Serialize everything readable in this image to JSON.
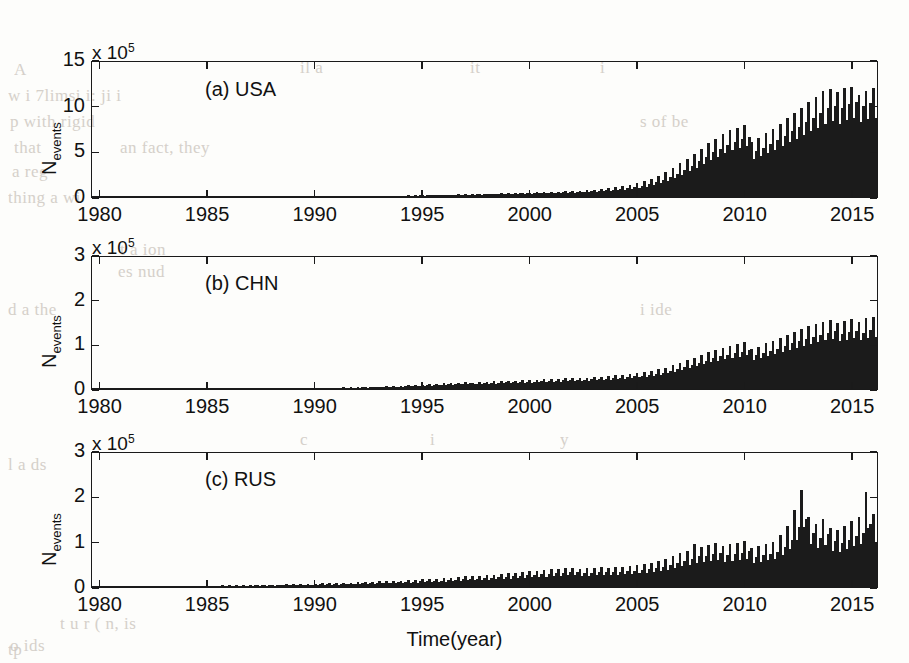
{
  "figure": {
    "xlabel": "Time(year)",
    "ylabel_main": "N",
    "ylabel_sub": "events",
    "exponent_prefix": "x 10",
    "exponent_power": "5",
    "x_ticks": [
      "1980",
      "1985",
      "1990",
      "1995",
      "2000",
      "2005",
      "2010",
      "2015"
    ],
    "bar_color": "#1b1b1b",
    "axis_color": "#1a1a1a",
    "background": "#fdfdfb"
  },
  "bleed_text": [
    {
      "t": "A",
      "x": 14,
      "y": 60
    },
    {
      "t": "w i  7limsi  i:  ji  i",
      "x": 8,
      "y": 86
    },
    {
      "t": "p  with  rigid",
      "x": 10,
      "y": 112
    },
    {
      "t": "that",
      "x": 14,
      "y": 138
    },
    {
      "t": "an  fact, they",
      "x": 120,
      "y": 138
    },
    {
      "t": "a  reg",
      "x": 12,
      "y": 162
    },
    {
      "t": "thing  a   wi",
      "x": 8,
      "y": 188
    },
    {
      "t": "il a",
      "x": 300,
      "y": 58
    },
    {
      "t": "it",
      "x": 470,
      "y": 58
    },
    {
      "t": "i",
      "x": 600,
      "y": 58
    },
    {
      "t": "s  of  be",
      "x": 640,
      "y": 112
    },
    {
      "t": "t  a  ion",
      "x": 120,
      "y": 240
    },
    {
      "t": "es  nud",
      "x": 118,
      "y": 262
    },
    {
      "t": "d  a  the",
      "x": 8,
      "y": 300
    },
    {
      "t": "i  ide",
      "x": 640,
      "y": 300
    },
    {
      "t": "c",
      "x": 300,
      "y": 430
    },
    {
      "t": "i",
      "x": 430,
      "y": 430
    },
    {
      "t": "y",
      "x": 560,
      "y": 430
    },
    {
      "t": "l  a  ds",
      "x": 8,
      "y": 455
    },
    {
      "t": "tp",
      "x": 8,
      "y": 640
    },
    {
      "t": "t u    r  (  n, is",
      "x": 60,
      "y": 614
    },
    {
      "t": "o  ids",
      "x": 10,
      "y": 636
    }
  ],
  "chart_data": [
    {
      "type": "bar",
      "panel_label": "(a) USA",
      "title": "",
      "xlabel": "",
      "ylabel": "N_events",
      "y_exponent": 100000,
      "ylim": [
        0,
        15
      ],
      "y_ticks": [
        0,
        5,
        10,
        15
      ],
      "xlim": [
        1979.6,
        2016.2
      ],
      "grid": false,
      "series_name": "USA",
      "x_start": 1979.7,
      "x_step": 0.0833,
      "values": [
        0.02,
        0.02,
        0.02,
        0.03,
        0.02,
        0.02,
        0.02,
        0.03,
        0.02,
        0.02,
        0.03,
        0.02,
        0.02,
        0.03,
        0.02,
        0.02,
        0.03,
        0.02,
        0.03,
        0.02,
        0.02,
        0.03,
        0.02,
        0.02,
        0.03,
        0.02,
        0.03,
        0.02,
        0.03,
        0.02,
        0.03,
        0.02,
        0.03,
        0.03,
        0.02,
        0.03,
        0.03,
        0.02,
        0.03,
        0.03,
        0.03,
        0.02,
        0.03,
        0.03,
        0.03,
        0.03,
        0.02,
        0.03,
        0.03,
        0.03,
        0.04,
        0.03,
        0.03,
        0.03,
        0.04,
        0.03,
        0.03,
        0.04,
        0.03,
        0.04,
        0.04,
        0.03,
        0.04,
        0.04,
        0.03,
        0.04,
        0.04,
        0.04,
        0.05,
        0.04,
        0.04,
        0.05,
        0.05,
        0.04,
        0.05,
        0.05,
        0.04,
        0.05,
        0.06,
        0.05,
        0.05,
        0.06,
        0.05,
        0.06,
        0.06,
        0.05,
        0.06,
        0.07,
        0.06,
        0.06,
        0.07,
        0.06,
        0.07,
        0.07,
        0.06,
        0.07,
        0.08,
        0.07,
        0.08,
        0.08,
        0.07,
        0.08,
        0.09,
        0.08,
        0.09,
        0.09,
        0.08,
        0.09,
        0.1,
        0.09,
        0.1,
        0.11,
        0.09,
        0.1,
        0.12,
        0.1,
        0.11,
        0.12,
        0.1,
        0.12,
        0.13,
        0.11,
        0.13,
        0.14,
        0.12,
        0.13,
        0.15,
        0.13,
        0.14,
        0.16,
        0.13,
        0.15,
        0.17,
        0.14,
        0.16,
        0.18,
        0.15,
        0.17,
        0.2,
        0.16,
        0.18,
        0.21,
        0.17,
        0.19,
        0.23,
        0.18,
        0.21,
        0.24,
        0.19,
        0.22,
        0.27,
        0.21,
        0.24,
        0.28,
        0.22,
        0.25,
        0.3,
        0.24,
        0.27,
        0.32,
        0.25,
        0.29,
        0.35,
        0.27,
        0.31,
        0.36,
        0.28,
        0.32,
        0.38,
        0.3,
        0.34,
        0.4,
        0.31,
        0.35,
        0.42,
        0.33,
        0.37,
        0.44,
        0.34,
        0.39,
        0.46,
        0.36,
        0.41,
        0.48,
        0.37,
        0.42,
        0.5,
        0.39,
        0.44,
        0.52,
        0.4,
        0.46,
        0.55,
        0.42,
        0.48,
        0.58,
        0.44,
        0.5,
        0.62,
        0.46,
        0.53,
        0.66,
        0.48,
        0.56,
        0.7,
        0.52,
        0.6,
        0.76,
        0.55,
        0.64,
        0.82,
        0.58,
        0.68,
        0.88,
        0.62,
        0.72,
        0.95,
        0.66,
        0.78,
        1.05,
        0.72,
        0.86,
        1.2,
        0.8,
        0.95,
        1.35,
        0.9,
        1.1,
        1.55,
        1.0,
        1.25,
        1.75,
        1.15,
        1.4,
        2.0,
        1.3,
        1.6,
        2.3,
        1.5,
        1.85,
        2.7,
        1.75,
        2.15,
        3.2,
        2.05,
        2.55,
        3.7,
        2.4,
        2.95,
        4.2,
        2.8,
        3.4,
        4.7,
        3.2,
        3.9,
        5.3,
        3.6,
        4.4,
        5.9,
        4.0,
        4.9,
        6.4,
        4.4,
        5.3,
        6.9,
        4.8,
        5.7,
        7.3,
        5.1,
        6.0,
        7.6,
        5.4,
        6.3,
        7.9,
        5.6,
        6.6,
        6.0,
        4.2,
        5.0,
        6.5,
        4.5,
        5.4,
        7.0,
        4.8,
        5.8,
        7.5,
        5.2,
        6.2,
        8.0,
        5.6,
        6.7,
        8.6,
        6.0,
        7.2,
        9.2,
        6.4,
        7.7,
        9.8,
        6.8,
        8.2,
        10.4,
        7.2,
        8.7,
        11.0,
        7.6,
        9.2,
        11.6,
        8.0,
        9.7,
        11.8,
        8.3,
        10.0,
        11.5,
        8.0,
        9.7,
        11.9,
        8.4,
        10.2,
        12.0,
        8.6,
        10.4,
        11.2,
        8.2,
        10.0,
        11.6,
        8.5,
        10.3,
        11.9,
        8.7,
        10.5
      ]
    },
    {
      "type": "bar",
      "panel_label": "(b) CHN",
      "title": "",
      "xlabel": "",
      "ylabel": "N_events",
      "y_exponent": 100000,
      "ylim": [
        0,
        3
      ],
      "y_ticks": [
        0,
        1,
        2,
        3
      ],
      "xlim": [
        1979.6,
        2016.2
      ],
      "grid": false,
      "series_name": "CHN",
      "x_start": 1979.7,
      "x_step": 0.0833,
      "values": [
        0.005,
        0.004,
        0.005,
        0.006,
        0.004,
        0.005,
        0.006,
        0.004,
        0.005,
        0.006,
        0.005,
        0.005,
        0.006,
        0.005,
        0.006,
        0.006,
        0.005,
        0.006,
        0.007,
        0.005,
        0.006,
        0.007,
        0.005,
        0.006,
        0.007,
        0.006,
        0.007,
        0.007,
        0.006,
        0.007,
        0.008,
        0.006,
        0.007,
        0.008,
        0.006,
        0.007,
        0.008,
        0.007,
        0.008,
        0.008,
        0.007,
        0.008,
        0.009,
        0.007,
        0.008,
        0.009,
        0.007,
        0.008,
        0.009,
        0.008,
        0.009,
        0.01,
        0.008,
        0.009,
        0.01,
        0.008,
        0.009,
        0.01,
        0.009,
        0.01,
        0.011,
        0.009,
        0.01,
        0.012,
        0.009,
        0.011,
        0.012,
        0.01,
        0.011,
        0.013,
        0.01,
        0.012,
        0.014,
        0.011,
        0.012,
        0.015,
        0.011,
        0.013,
        0.016,
        0.012,
        0.014,
        0.017,
        0.013,
        0.015,
        0.018,
        0.014,
        0.016,
        0.02,
        0.015,
        0.017,
        0.022,
        0.016,
        0.019,
        0.024,
        0.018,
        0.021,
        0.026,
        0.019,
        0.022,
        0.028,
        0.021,
        0.024,
        0.031,
        0.023,
        0.027,
        0.034,
        0.025,
        0.029,
        0.037,
        0.027,
        0.032,
        0.041,
        0.03,
        0.035,
        0.045,
        0.033,
        0.038,
        0.05,
        0.036,
        0.042,
        0.055,
        0.04,
        0.046,
        0.06,
        0.044,
        0.051,
        0.066,
        0.048,
        0.056,
        0.073,
        0.053,
        0.061,
        0.08,
        0.058,
        0.067,
        0.088,
        0.064,
        0.074,
        0.096,
        0.07,
        0.081,
        0.105,
        0.076,
        0.088,
        0.115,
        0.083,
        0.096,
        0.125,
        0.091,
        0.105,
        0.135,
        0.098,
        0.113,
        0.145,
        0.105,
        0.122,
        0.15,
        0.11,
        0.126,
        0.145,
        0.105,
        0.121,
        0.155,
        0.112,
        0.13,
        0.16,
        0.116,
        0.134,
        0.17,
        0.123,
        0.142,
        0.175,
        0.127,
        0.147,
        0.182,
        0.132,
        0.152,
        0.19,
        0.138,
        0.159,
        0.195,
        0.142,
        0.163,
        0.2,
        0.145,
        0.168,
        0.21,
        0.152,
        0.176,
        0.215,
        0.156,
        0.18,
        0.225,
        0.163,
        0.188,
        0.23,
        0.167,
        0.193,
        0.24,
        0.174,
        0.201,
        0.25,
        0.181,
        0.209,
        0.245,
        0.178,
        0.205,
        0.255,
        0.185,
        0.214,
        0.265,
        0.192,
        0.222,
        0.275,
        0.199,
        0.23,
        0.29,
        0.21,
        0.243,
        0.305,
        0.221,
        0.256,
        0.32,
        0.232,
        0.268,
        0.34,
        0.247,
        0.285,
        0.36,
        0.261,
        0.302,
        0.385,
        0.279,
        0.323,
        0.41,
        0.297,
        0.344,
        0.44,
        0.319,
        0.369,
        0.48,
        0.348,
        0.402,
        0.53,
        0.384,
        0.444,
        0.58,
        0.42,
        0.486,
        0.64,
        0.464,
        0.536,
        0.7,
        0.507,
        0.587,
        0.76,
        0.551,
        0.637,
        0.82,
        0.594,
        0.687,
        0.88,
        0.638,
        0.738,
        0.92,
        0.667,
        0.771,
        0.96,
        0.696,
        0.805,
        1.0,
        0.725,
        0.838,
        1.05,
        0.761,
        0.88,
        0.9,
        0.652,
        0.754,
        0.95,
        0.688,
        0.796,
        1.02,
        0.739,
        0.855,
        1.08,
        0.783,
        0.905,
        1.15,
        0.834,
        0.964,
        1.22,
        0.884,
        1.022,
        1.28,
        0.928,
        1.073,
        1.34,
        0.971,
        1.123,
        1.4,
        1.015,
        1.173,
        1.45,
        1.051,
        1.215,
        1.5,
        1.088,
        1.257,
        1.54,
        1.116,
        1.291,
        1.48,
        1.073,
        1.24,
        1.52,
        1.102,
        1.274,
        1.56,
        1.131,
        1.308,
        1.5,
        1.088,
        1.257,
        1.58,
        1.145,
        1.324,
        1.62,
        1.175,
        1.358
      ]
    },
    {
      "type": "bar",
      "panel_label": "(c) RUS",
      "title": "",
      "xlabel": "Time(year)",
      "ylabel": "N_events",
      "y_exponent": 100000,
      "ylim": [
        0,
        3
      ],
      "y_ticks": [
        0,
        1,
        2,
        3
      ],
      "xlim": [
        1979.6,
        2016.2
      ],
      "grid": false,
      "series_name": "RUS",
      "x_start": 1979.7,
      "x_step": 0.0833,
      "values": [
        0.01,
        0.008,
        0.012,
        0.03,
        0.009,
        0.011,
        0.014,
        0.009,
        0.012,
        0.015,
        0.01,
        0.012,
        0.016,
        0.01,
        0.013,
        0.017,
        0.011,
        0.013,
        0.018,
        0.011,
        0.014,
        0.019,
        0.012,
        0.015,
        0.02,
        0.013,
        0.016,
        0.021,
        0.013,
        0.016,
        0.022,
        0.014,
        0.017,
        0.023,
        0.015,
        0.018,
        0.024,
        0.015,
        0.019,
        0.026,
        0.016,
        0.02,
        0.028,
        0.017,
        0.021,
        0.029,
        0.018,
        0.022,
        0.031,
        0.019,
        0.024,
        0.033,
        0.02,
        0.025,
        0.035,
        0.022,
        0.027,
        0.055,
        0.023,
        0.028,
        0.039,
        0.024,
        0.03,
        0.041,
        0.026,
        0.032,
        0.044,
        0.027,
        0.034,
        0.046,
        0.029,
        0.036,
        0.049,
        0.03,
        0.038,
        0.052,
        0.032,
        0.04,
        0.055,
        0.034,
        0.042,
        0.058,
        0.036,
        0.045,
        0.062,
        0.038,
        0.048,
        0.065,
        0.04,
        0.05,
        0.069,
        0.043,
        0.053,
        0.073,
        0.045,
        0.056,
        0.078,
        0.048,
        0.06,
        0.082,
        0.051,
        0.063,
        0.087,
        0.054,
        0.067,
        0.092,
        0.057,
        0.071,
        0.098,
        0.06,
        0.075,
        0.103,
        0.064,
        0.08,
        0.109,
        0.067,
        0.084,
        0.115,
        0.071,
        0.089,
        0.135,
        0.078,
        0.098,
        0.128,
        0.079,
        0.099,
        0.135,
        0.083,
        0.104,
        0.142,
        0.088,
        0.11,
        0.15,
        0.092,
        0.116,
        0.158,
        0.097,
        0.122,
        0.166,
        0.102,
        0.128,
        0.175,
        0.108,
        0.135,
        0.185,
        0.114,
        0.143,
        0.195,
        0.12,
        0.151,
        0.205,
        0.126,
        0.158,
        0.215,
        0.133,
        0.166,
        0.24,
        0.148,
        0.186,
        0.235,
        0.145,
        0.182,
        0.248,
        0.153,
        0.192,
        0.26,
        0.16,
        0.201,
        0.275,
        0.17,
        0.213,
        0.288,
        0.178,
        0.223,
        0.3,
        0.185,
        0.232,
        0.315,
        0.194,
        0.244,
        0.33,
        0.203,
        0.255,
        0.345,
        0.213,
        0.267,
        0.36,
        0.222,
        0.278,
        0.375,
        0.231,
        0.29,
        0.39,
        0.24,
        0.302,
        0.405,
        0.25,
        0.313,
        0.418,
        0.258,
        0.323,
        0.43,
        0.265,
        0.333,
        0.395,
        0.244,
        0.306,
        0.41,
        0.253,
        0.317,
        0.425,
        0.262,
        0.329,
        0.44,
        0.271,
        0.34,
        0.42,
        0.259,
        0.325,
        0.435,
        0.268,
        0.337,
        0.45,
        0.278,
        0.348,
        0.47,
        0.29,
        0.364,
        0.49,
        0.302,
        0.379,
        0.51,
        0.315,
        0.395,
        0.54,
        0.333,
        0.418,
        0.57,
        0.352,
        0.441,
        0.62,
        0.382,
        0.48,
        0.68,
        0.419,
        0.526,
        0.74,
        0.456,
        0.573,
        0.8,
        0.493,
        0.619,
        0.95,
        0.54,
        0.678,
        0.88,
        0.542,
        0.681,
        0.93,
        0.573,
        0.72,
        0.98,
        0.604,
        0.758,
        0.9,
        0.555,
        0.697,
        0.94,
        0.579,
        0.727,
        0.98,
        0.604,
        0.758,
        1.02,
        0.629,
        0.789,
        0.85,
        0.524,
        0.658,
        0.9,
        0.555,
        0.697,
        0.95,
        0.586,
        0.735,
        1.0,
        0.616,
        0.774,
        1.15,
        0.709,
        0.89,
        1.35,
        0.832,
        1.045,
        1.7,
        1.048,
        1.316,
        2.15,
        1.325,
        1.5,
        1.55,
        0.955,
        1.2,
        1.4,
        0.863,
        1.083,
        1.5,
        0.925,
        1.161,
        1.3,
        0.801,
        1.006,
        1.25,
        0.77,
        0.967,
        1.35,
        0.832,
        1.045,
        1.45,
        0.894,
        1.122,
        1.55,
        0.955,
        1.2,
        2.1,
        1.294,
        1.4,
        1.6,
        0.986,
        1.238
      ]
    }
  ]
}
